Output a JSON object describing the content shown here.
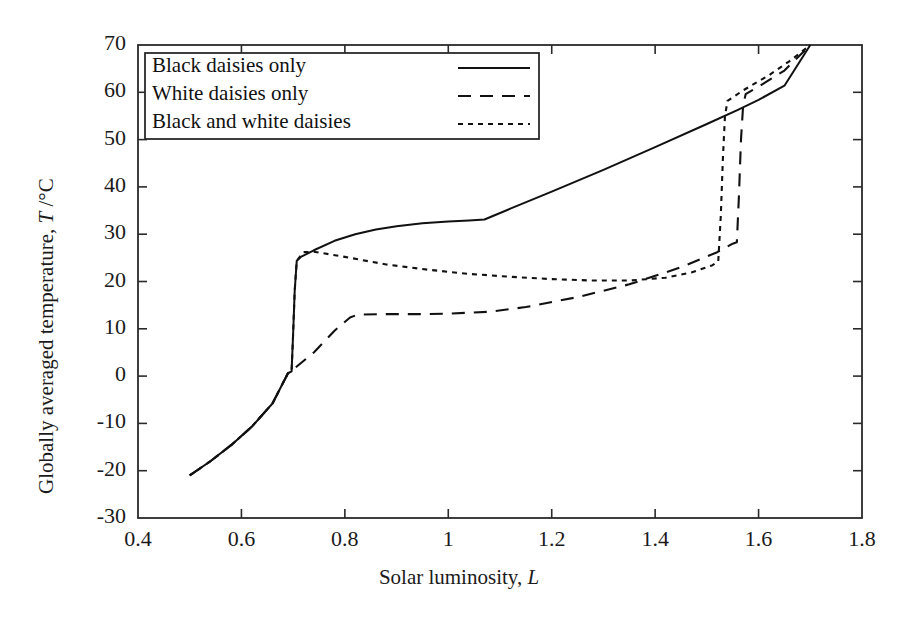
{
  "chart_data": {
    "type": "line",
    "title": "",
    "xlabel": "Solar luminosity, L",
    "ylabel": "Globally averaged temperature, T /°C",
    "xlim": [
      0.4,
      1.8
    ],
    "ylim": [
      -30,
      70
    ],
    "xticks": [
      "0.4",
      "0.6",
      "0.8",
      "1",
      "1.2",
      "1.4",
      "1.6",
      "1.8"
    ],
    "xtick_values": [
      0.4,
      0.6,
      0.8,
      1.0,
      1.2,
      1.4,
      1.6,
      1.8
    ],
    "yticks": [
      "70",
      "60",
      "50",
      "40",
      "30",
      "20",
      "10",
      "0",
      "-10",
      "-20",
      "-30"
    ],
    "ytick_values": [
      70,
      60,
      50,
      40,
      30,
      20,
      10,
      0,
      -10,
      -20,
      -30
    ],
    "grid": false,
    "legend_position": "top-left",
    "frame": "box",
    "series": [
      {
        "name": "Black daisies only",
        "style": "solid",
        "points": [
          [
            0.5,
            -21.0
          ],
          [
            0.54,
            -18.0
          ],
          [
            0.58,
            -14.6
          ],
          [
            0.62,
            -10.7
          ],
          [
            0.66,
            -5.8
          ],
          [
            0.69,
            0.6
          ],
          [
            0.697,
            1.0
          ],
          [
            0.7,
            9.0
          ],
          [
            0.703,
            18.0
          ],
          [
            0.707,
            24.4
          ],
          [
            0.715,
            25.2
          ],
          [
            0.74,
            26.6
          ],
          [
            0.78,
            28.6
          ],
          [
            0.82,
            30.0
          ],
          [
            0.86,
            31.0
          ],
          [
            0.9,
            31.7
          ],
          [
            0.95,
            32.3
          ],
          [
            1.0,
            32.7
          ],
          [
            1.04,
            32.9
          ],
          [
            1.07,
            33.1
          ],
          [
            1.12,
            35.4
          ],
          [
            1.2,
            39.0
          ],
          [
            1.3,
            43.6
          ],
          [
            1.4,
            48.4
          ],
          [
            1.5,
            53.3
          ],
          [
            1.56,
            56.3
          ],
          [
            1.6,
            58.4
          ],
          [
            1.65,
            61.4
          ],
          [
            1.7,
            70.0
          ]
        ]
      },
      {
        "name": "White daisies only",
        "style": "dashed",
        "points": [
          [
            0.5,
            -21.0
          ],
          [
            0.54,
            -18.0
          ],
          [
            0.58,
            -14.6
          ],
          [
            0.62,
            -10.7
          ],
          [
            0.66,
            -5.8
          ],
          [
            0.69,
            0.6
          ],
          [
            0.7,
            1.4
          ],
          [
            0.74,
            5.0
          ],
          [
            0.78,
            9.6
          ],
          [
            0.81,
            12.4
          ],
          [
            0.825,
            13.0
          ],
          [
            0.88,
            13.1
          ],
          [
            0.95,
            13.1
          ],
          [
            1.0,
            13.2
          ],
          [
            1.08,
            13.6
          ],
          [
            1.15,
            14.6
          ],
          [
            1.25,
            16.7
          ],
          [
            1.35,
            19.4
          ],
          [
            1.45,
            23.0
          ],
          [
            1.52,
            26.2
          ],
          [
            1.55,
            28.0
          ],
          [
            1.558,
            28.3
          ],
          [
            1.562,
            38.0
          ],
          [
            1.566,
            50.0
          ],
          [
            1.57,
            57.0
          ],
          [
            1.575,
            59.6
          ],
          [
            1.6,
            61.2
          ],
          [
            1.65,
            64.6
          ],
          [
            1.7,
            70.0
          ]
        ]
      },
      {
        "name": "Black and white daisies",
        "style": "dotted",
        "points": [
          [
            0.5,
            -21.0
          ],
          [
            0.54,
            -18.0
          ],
          [
            0.58,
            -14.6
          ],
          [
            0.62,
            -10.7
          ],
          [
            0.66,
            -5.8
          ],
          [
            0.69,
            0.6
          ],
          [
            0.697,
            1.0
          ],
          [
            0.7,
            9.0
          ],
          [
            0.703,
            18.0
          ],
          [
            0.707,
            24.4
          ],
          [
            0.72,
            26.2
          ],
          [
            0.74,
            26.3
          ],
          [
            0.8,
            25.2
          ],
          [
            0.88,
            23.6
          ],
          [
            0.96,
            22.5
          ],
          [
            1.04,
            21.6
          ],
          [
            1.12,
            21.0
          ],
          [
            1.2,
            20.5
          ],
          [
            1.28,
            20.2
          ],
          [
            1.35,
            20.2
          ],
          [
            1.42,
            20.8
          ],
          [
            1.47,
            21.9
          ],
          [
            1.51,
            23.4
          ],
          [
            1.522,
            24.2
          ],
          [
            1.527,
            34.0
          ],
          [
            1.531,
            46.0
          ],
          [
            1.535,
            55.0
          ],
          [
            1.54,
            58.2
          ],
          [
            1.57,
            60.4
          ],
          [
            1.62,
            63.6
          ],
          [
            1.66,
            66.6
          ],
          [
            1.7,
            70.0
          ]
        ]
      }
    ]
  },
  "legend": {
    "entries": [
      {
        "label": "Black daisies only",
        "style": "solid"
      },
      {
        "label": "White daisies only",
        "style": "dashed"
      },
      {
        "label": "Black and white daisies",
        "style": "dotted"
      }
    ]
  },
  "axes": {
    "x_title_main": "Solar luminosity,",
    "x_title_symbol": "L",
    "y_title_main": "Globally averaged temperature,",
    "y_title_symbol": "T",
    "y_title_unit": "/°C"
  },
  "colors": {
    "line": "#111111",
    "frame": "#2a2a2a",
    "text": "#1a1a1a",
    "background": "#ffffff"
  }
}
